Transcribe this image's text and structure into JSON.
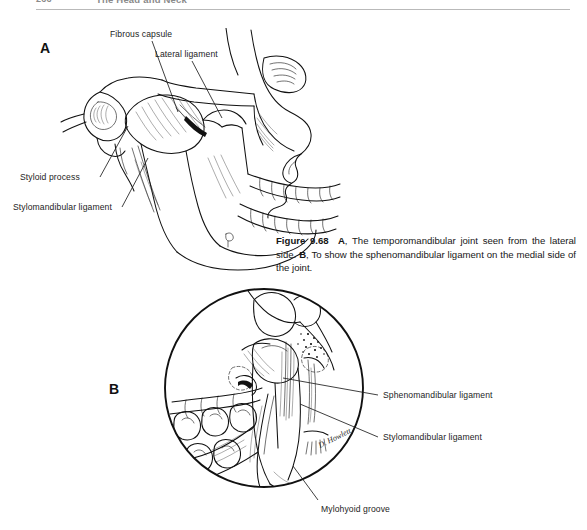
{
  "page": {
    "background_color": "#ffffff",
    "ink_color": "#111111",
    "width": 587,
    "height": 530
  },
  "running_head": {
    "page_number": "266",
    "chapter_title": "The Head and Neck",
    "color": "#8a8a8a"
  },
  "panels": [
    {
      "id": "A",
      "letter": "A"
    },
    {
      "id": "B",
      "letter": "B"
    }
  ],
  "figure_caption": {
    "figure_number": "Figure 9.68",
    "part_a_marker": "A",
    "part_a_text": ", The temporomandibular joint seen from the lateral side. ",
    "part_b_marker": "B",
    "part_b_text": ", To show the sphenomandibular ligament on the medial side of the joint."
  },
  "labels_panel_a": [
    {
      "name": "fibrous-capsule",
      "text": "Fibrous capsule"
    },
    {
      "name": "lateral-ligament",
      "text": "Lateral ligament"
    },
    {
      "name": "styloid-process",
      "text": "Styloid process"
    },
    {
      "name": "stylomandibular-ligament",
      "text": "Stylomandibular ligament"
    }
  ],
  "labels_panel_b": [
    {
      "name": "sphenomandibular-ligament",
      "text": "Sphenomandibular ligament"
    },
    {
      "name": "stylomandibular-ligament",
      "text": "Stylomandibular ligament"
    },
    {
      "name": "mylohyoid-groove",
      "text": "Mylohyoid groove"
    }
  ],
  "artist_signature": "D. Howlett"
}
